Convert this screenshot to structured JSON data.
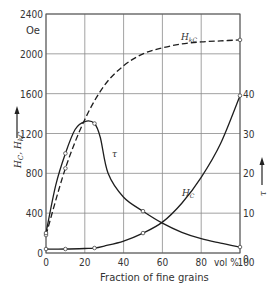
{
  "chart_data": {
    "type": "line",
    "title": "",
    "xlabel": "Fraction of fine grains",
    "x_unit": "vol %",
    "ylabel_left": "H_C, H_kC",
    "ylabel_left_unit": "Oe",
    "ylabel_right": "τ",
    "xlim": [
      0,
      100
    ],
    "ylim_left": [
      0,
      2400
    ],
    "ylim_right": [
      0,
      60
    ],
    "x_ticks": [
      "0",
      "20",
      "40",
      "60",
      "80",
      "100"
    ],
    "y_ticks_left": [
      "0",
      "400",
      "800",
      "1200",
      "1600",
      "2000",
      "2400"
    ],
    "y_ticks_right": [
      "0",
      "10",
      "20",
      "30",
      "40"
    ],
    "grid": true,
    "series": [
      {
        "name": "H_kC",
        "axis": "left",
        "style": "dashed",
        "x": [
          0,
          10,
          20,
          30,
          40,
          50,
          60,
          70,
          80,
          90,
          100
        ],
        "y": [
          180,
          850,
          1340,
          1680,
          1880,
          2000,
          2060,
          2100,
          2120,
          2130,
          2140
        ]
      },
      {
        "name": "τ",
        "axis": "right",
        "style": "solid",
        "x": [
          0,
          5,
          10,
          15,
          20,
          25,
          28,
          32,
          40,
          50,
          60,
          70,
          80,
          90,
          100
        ],
        "y": [
          5,
          17,
          25,
          31,
          33,
          32.5,
          29,
          20,
          14,
          10.5,
          7.5,
          5.2,
          3.6,
          2.5,
          1.5
        ]
      },
      {
        "name": "H_C",
        "axis": "left",
        "style": "solid",
        "x": [
          0,
          10,
          20,
          25,
          30,
          40,
          50,
          60,
          70,
          80,
          90,
          100
        ],
        "y": [
          40,
          40,
          45,
          50,
          70,
          120,
          200,
          310,
          500,
          760,
          1100,
          1580
        ]
      }
    ],
    "annotations": [
      {
        "text": "H_kC",
        "near": "dashed curve at x≈68"
      },
      {
        "text": "τ",
        "near": "solid peak curve at x≈33"
      },
      {
        "text": "H_C",
        "near": "rising curve at x≈62"
      }
    ]
  },
  "labels": {
    "unit_oe": "Oe",
    "xlabel": "Fraction of fine grains",
    "x_unit": "vol %",
    "y_left": "H",
    "y_left_sub1": "C",
    "y_left_sep": ", H",
    "y_left_sub2": "kC",
    "y_right": "τ",
    "hkc": "H",
    "hkc_sub": "kC",
    "tau": "τ",
    "hc": "H",
    "hc_sub": "C"
  }
}
